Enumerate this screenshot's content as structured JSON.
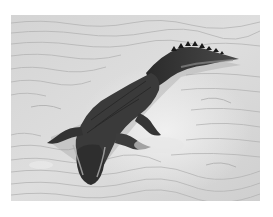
{
  "image": {
    "alt": "Crocodile lying on rippled sand, black and white photograph",
    "subject": "crocodile",
    "background": "rippled sand",
    "tone": "grayscale",
    "colors": {
      "border": "#ffffff",
      "sand_light": "#e2e2e2",
      "sand_mid": "#c9c9c9",
      "ripple_dark": "#a8a8a8",
      "croc_body": "#3a3a3a",
      "croc_dark": "#1e1e1e",
      "croc_belly_light": "#8a8a8a"
    }
  }
}
